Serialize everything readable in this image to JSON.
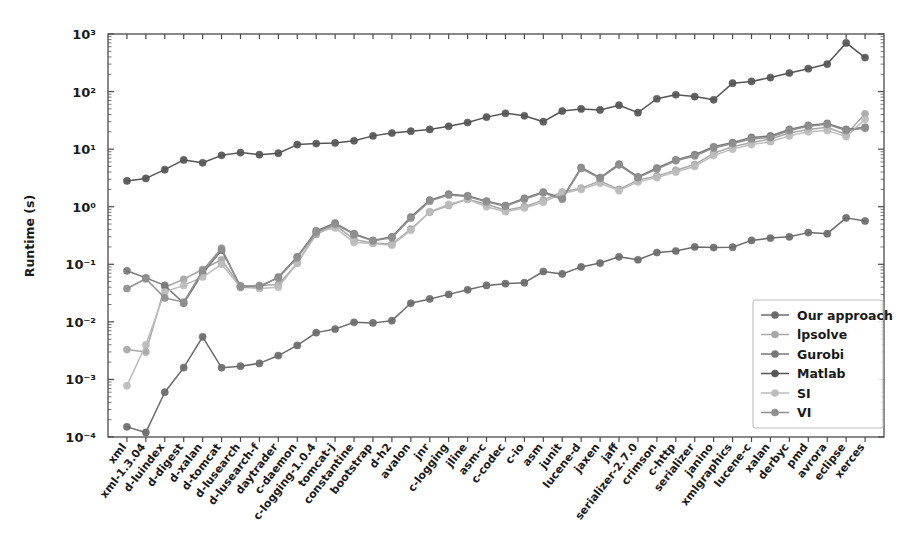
{
  "chart_data": {
    "type": "line",
    "title": "",
    "xlabel": "",
    "ylabel": "Runtime (s)",
    "yscale": "log",
    "ylim": [
      0.0001,
      1000
    ],
    "ytick_labels": [
      "10³",
      "10²",
      "10¹",
      "10⁰",
      "10⁻¹",
      "10⁻²",
      "10⁻³",
      "10⁻⁴"
    ],
    "ytick_values": [
      1000,
      100,
      10,
      1,
      0.1,
      0.01,
      0.001,
      0.0001
    ],
    "grid": false,
    "legend_position": "lower right",
    "categories": [
      "xml",
      "xml-1.3.04",
      "d-luindex",
      "d-digest",
      "d-xalan",
      "d-tomcat",
      "d-lusearch",
      "d-lusearch-f",
      "daytrader",
      "c-daemon",
      "c-logging-1.0.4",
      "tomcat-j",
      "constantine",
      "bootstrap",
      "d-h2",
      "avalon",
      "jnr",
      "c-logging",
      "jline",
      "asm-c",
      "c-codec",
      "c-io",
      "asm",
      "junit",
      "lucene-d",
      "jaxen",
      "jaff",
      "serializer-2.7.0",
      "crimson",
      "c-http",
      "serializer",
      "janino",
      "xmlgraphics",
      "lucene-c",
      "xalan",
      "derbyc",
      "pmd",
      "avrora",
      "eclipse",
      "xerces"
    ],
    "series": [
      {
        "name": "Our approach",
        "color": "#6b6b6b",
        "values": [
          0.00015,
          0.00012,
          0.0006,
          0.0016,
          0.0055,
          0.0016,
          0.0017,
          0.0019,
          0.0026,
          0.0039,
          0.0065,
          0.0075,
          0.0098,
          0.0096,
          0.0105,
          0.021,
          0.025,
          0.03,
          0.036,
          0.043,
          0.046,
          0.048,
          0.075,
          0.068,
          0.09,
          0.105,
          0.135,
          0.12,
          0.16,
          0.17,
          0.2,
          0.195,
          0.198,
          0.26,
          0.285,
          0.3,
          0.355,
          0.34,
          0.64,
          0.565
        ]
      },
      {
        "name": "lpsolve",
        "color": "#a8a8a8",
        "values": [
          0.0033,
          0.003,
          0.04,
          0.055,
          0.082,
          0.12,
          0.042,
          0.043,
          0.044,
          0.105,
          0.33,
          0.48,
          0.27,
          0.235,
          0.225,
          0.41,
          0.8,
          1.05,
          1.35,
          1.1,
          0.87,
          1.0,
          1.3,
          1.8,
          2.1,
          2.8,
          2.0,
          2.9,
          3.4,
          4.3,
          5.4,
          8.5,
          11.0,
          13.0,
          15.0,
          19.0,
          22.0,
          24.0,
          18.0,
          41.0
        ]
      },
      {
        "name": "Gurobi",
        "color": "#777777",
        "values": [
          0.077,
          0.058,
          0.043,
          0.021,
          0.07,
          0.175,
          0.042,
          0.04,
          0.06,
          0.135,
          0.38,
          0.52,
          0.34,
          0.26,
          0.3,
          0.66,
          1.3,
          1.65,
          1.55,
          1.25,
          1.05,
          1.4,
          1.8,
          1.4,
          4.8,
          3.2,
          5.5,
          3.3,
          4.7,
          6.5,
          8.0,
          11.0,
          13.0,
          16.0,
          17.0,
          22.0,
          26.0,
          28.0,
          22.0,
          24.0
        ]
      },
      {
        "name": "Matlab",
        "color": "#555555",
        "values": [
          2.8,
          3.1,
          4.4,
          6.5,
          5.8,
          7.8,
          8.7,
          8.0,
          8.5,
          12.0,
          12.5,
          12.8,
          14.0,
          17.0,
          19.0,
          20.5,
          22.0,
          25.0,
          29.0,
          36.0,
          42.0,
          38.0,
          30.0,
          46.0,
          50.0,
          48.0,
          58.0,
          43.0,
          75.0,
          88.0,
          82.0,
          72.0,
          140.0,
          150.0,
          175.0,
          210.0,
          250.0,
          300.0,
          700.0,
          390.0
        ]
      },
      {
        "name": "SI",
        "color": "#bcbcbc",
        "values": [
          0.00078,
          0.004,
          0.033,
          0.043,
          0.06,
          0.1,
          0.04,
          0.038,
          0.04,
          0.105,
          0.36,
          0.43,
          0.24,
          0.23,
          0.215,
          0.39,
          0.82,
          1.1,
          1.35,
          1.0,
          0.82,
          0.95,
          1.2,
          1.7,
          2.0,
          2.55,
          1.9,
          2.7,
          3.2,
          4.0,
          5.0,
          7.8,
          10.0,
          12.0,
          13.5,
          17.0,
          20.0,
          21.0,
          16.5,
          33.0
        ]
      },
      {
        "name": "VI",
        "color": "#8f8f8f",
        "values": [
          0.038,
          0.056,
          0.026,
          0.022,
          0.078,
          0.19,
          0.04,
          0.042,
          0.058,
          0.13,
          0.36,
          0.5,
          0.33,
          0.255,
          0.29,
          0.63,
          1.25,
          1.6,
          1.5,
          1.22,
          1.02,
          1.35,
          1.75,
          1.35,
          4.6,
          3.1,
          5.3,
          3.2,
          4.5,
          6.3,
          7.6,
          10.5,
          12.5,
          15.0,
          16.0,
          21.0,
          25.0,
          27.0,
          21.0,
          23.0
        ]
      }
    ]
  },
  "legend": {
    "items": [
      {
        "label": "Our approach"
      },
      {
        "label": "lpsolve"
      },
      {
        "label": "Gurobi"
      },
      {
        "label": "Matlab"
      },
      {
        "label": "SI"
      },
      {
        "label": "VI"
      }
    ]
  }
}
